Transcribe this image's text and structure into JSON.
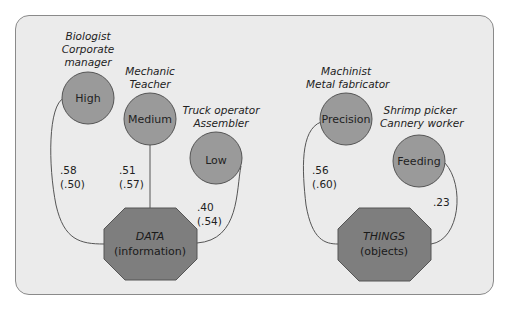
{
  "colors": {
    "panel_bg": "#ebebeb",
    "panel_border": "#8a8a8a",
    "circle_fill": "#9a9a9a",
    "hub_fill": "#7e7e7e",
    "stroke": "#555555"
  },
  "hubs": [
    {
      "id": "data",
      "title": "DATA",
      "subtitle": "(information)",
      "levels": [
        {
          "label": "High",
          "occupations": [
            "Biologist",
            "Corporate",
            "manager"
          ],
          "coefficient": ".58",
          "coefficient_alt": "(.50)"
        },
        {
          "label": "Medium",
          "occupations": [
            "Mechanic",
            "Teacher"
          ],
          "coefficient": ".51",
          "coefficient_alt": "(.57)"
        },
        {
          "label": "Low",
          "occupations": [
            "Truck operator",
            "Assembler"
          ],
          "coefficient": ".40",
          "coefficient_alt": "(.54)"
        }
      ]
    },
    {
      "id": "things",
      "title": "THINGS",
      "subtitle": "(objects)",
      "levels": [
        {
          "label": "Precision",
          "occupations": [
            "Machinist",
            "Metal fabricator"
          ],
          "coefficient": ".56",
          "coefficient_alt": "(.60)"
        },
        {
          "label": "Feeding",
          "occupations": [
            "Shrimp picker",
            "Cannery worker"
          ],
          "coefficient": ".23",
          "coefficient_alt": ""
        }
      ]
    }
  ]
}
